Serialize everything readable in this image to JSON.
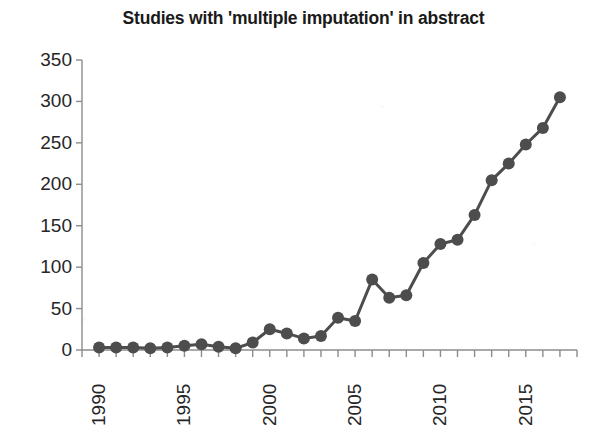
{
  "chart_data": {
    "type": "line",
    "title": "Studies with 'multiple imputation' in abstract",
    "subtitle": "",
    "xlabel": "",
    "ylabel": "",
    "x": [
      1991,
      1992,
      1993,
      1994,
      1995,
      1996,
      1997,
      1998,
      1999,
      2000,
      2001,
      2002,
      2003,
      2004,
      2005,
      2006,
      2007,
      2008,
      2009,
      2010,
      2011,
      2012,
      2013,
      2014,
      2015,
      2016,
      2017,
      2018
    ],
    "values": [
      3,
      3,
      3,
      2,
      3,
      5,
      7,
      4,
      2,
      9,
      25,
      20,
      14,
      17,
      39,
      35,
      85,
      63,
      66,
      105,
      128,
      133,
      163,
      205,
      225,
      248,
      268,
      305
    ],
    "series": [
      {
        "name": "Studies",
        "values": [
          3,
          3,
          3,
          2,
          3,
          5,
          7,
          4,
          2,
          9,
          25,
          20,
          14,
          17,
          39,
          35,
          85,
          63,
          66,
          105,
          128,
          133,
          163,
          205,
          225,
          248,
          268,
          305
        ]
      }
    ],
    "xlim": [
      1990,
      2019
    ],
    "ylim": [
      0,
      350
    ],
    "yticks": [
      0,
      50,
      100,
      150,
      200,
      250,
      300,
      350
    ],
    "ytick_labels": [
      "0",
      "50",
      "100",
      "150",
      "200",
      "250",
      "300",
      "350"
    ],
    "xticks": [
      1990,
      1995,
      2000,
      2005,
      2010,
      2015
    ],
    "xtick_labels": [
      "1990",
      "1995",
      "2000",
      "2005",
      "2010",
      "2015"
    ],
    "xtick_rotation": -90,
    "grid": false,
    "legend": false,
    "legend_position": "none",
    "marker": "circle",
    "marker_size": 6,
    "line_width": 3,
    "colors": {
      "line": "#4d4d4d",
      "marker": "#4d4d4d",
      "axis": "#8c8c8c",
      "text": "#262626",
      "title": "#1a1a1a",
      "background": "#ffffff"
    }
  }
}
